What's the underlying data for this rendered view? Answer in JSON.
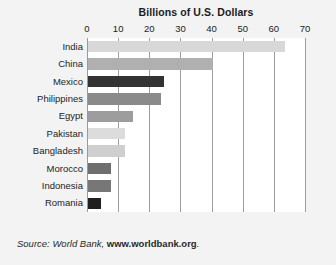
{
  "chart_data": {
    "type": "bar",
    "orientation": "horizontal",
    "title": "Billions of U.S. Dollars",
    "xlabel": "",
    "ylabel": "",
    "xlim": [
      0,
      70
    ],
    "xticks": [
      0,
      10,
      20,
      30,
      40,
      50,
      60,
      70
    ],
    "grid": "vertical",
    "legend": "none",
    "categories": [
      "India",
      "China",
      "Mexico",
      "Philippines",
      "Egypt",
      "Pakistan",
      "Bangladesh",
      "Morocco",
      "Indonesia",
      "Romania"
    ],
    "values": [
      63.3,
      40.1,
      24.4,
      23.4,
      14.5,
      11.9,
      11.9,
      7.4,
      7.4,
      4.2
    ],
    "bar_colors": [
      "#d8d8d8",
      "#b0b0b0",
      "#333333",
      "#8a8a8a",
      "#9d9d9d",
      "#dcdcdc",
      "#cfcfcf",
      "#6e6e6e",
      "#777777",
      "#1f1f1f"
    ],
    "bars": [
      {
        "label": "India",
        "value": 63.3,
        "color": "#d8d8d8"
      },
      {
        "label": "China",
        "value": 40.1,
        "color": "#b0b0b0"
      },
      {
        "label": "Mexico",
        "value": 24.4,
        "color": "#333333"
      },
      {
        "label": "Philippines",
        "value": 23.4,
        "color": "#8a8a8a"
      },
      {
        "label": "Egypt",
        "value": 14.5,
        "color": "#9d9d9d"
      },
      {
        "label": "Pakistan",
        "value": 11.9,
        "color": "#dcdcdc"
      },
      {
        "label": "Bangladesh",
        "value": 11.9,
        "color": "#cfcfcf"
      },
      {
        "label": "Morocco",
        "value": 7.4,
        "color": "#6e6e6e"
      },
      {
        "label": "Indonesia",
        "value": 7.4,
        "color": "#777777"
      },
      {
        "label": "Romania",
        "value": 4.2,
        "color": "#1f1f1f"
      }
    ]
  },
  "source": {
    "prefix": "Source: World Bank, ",
    "url": "www.worldbank.org",
    "suffix": "."
  },
  "colors": {
    "background": "#f3f3f3",
    "plot_background": "#ffffff",
    "gridline": "#9d9d9d",
    "text": "#1d1d1d"
  }
}
